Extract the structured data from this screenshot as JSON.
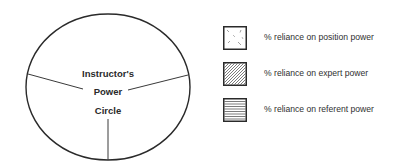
{
  "diagram": {
    "title_lines": [
      "Instructor's",
      "Power",
      "Circle"
    ],
    "circle": {
      "center_x": 108,
      "center_y": 87,
      "radius_x": 82,
      "radius_y": 73,
      "stroke_color": "#2a2a2a"
    },
    "dividers": [
      {
        "name": "left-divider",
        "x1": 28,
        "y1": 74,
        "x2": 83,
        "y2": 89
      },
      {
        "name": "right-divider",
        "x1": 188,
        "y1": 75,
        "x2": 128,
        "y2": 90
      },
      {
        "name": "bottom-divider",
        "x1": 108,
        "y1": 119,
        "x2": 108,
        "y2": 160
      }
    ]
  },
  "legend": {
    "items": [
      {
        "pattern": "scattered-dashes",
        "label": "% reliance on position power"
      },
      {
        "pattern": "diagonal-hatch",
        "label": "% reliance on expert power"
      },
      {
        "pattern": "horizontal-lines",
        "label": "% reliance on referent power"
      }
    ]
  }
}
